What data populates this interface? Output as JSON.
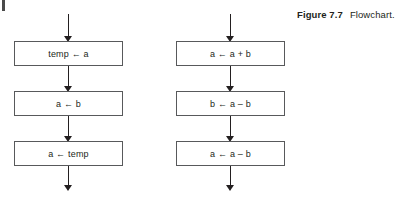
{
  "figure": {
    "label": "Figure 7.7",
    "caption": "Flowchart."
  },
  "flowcharts": [
    {
      "name": "swap-using-temp",
      "nodes": [
        {
          "label": "temp ← a"
        },
        {
          "label": "a ← b"
        },
        {
          "label": "a ← temp"
        }
      ]
    },
    {
      "name": "swap-using-arithmetic",
      "nodes": [
        {
          "label": "a ← a + b"
        },
        {
          "label": "b ← a – b"
        },
        {
          "label": "a ← a – b"
        }
      ]
    }
  ],
  "colors": {
    "box_border": "#58595b",
    "line": "#231f20",
    "text": "#231f20",
    "background": "#ffffff"
  }
}
